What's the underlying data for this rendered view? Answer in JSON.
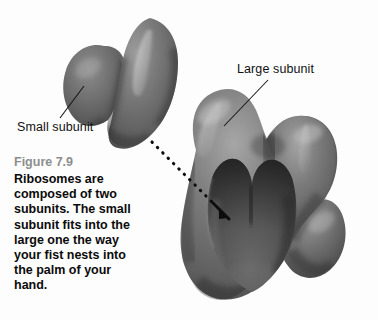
{
  "figure": {
    "background_color": "#fdfdfd",
    "labels": {
      "small_subunit": "Small subunit",
      "large_subunit": "Large subunit"
    },
    "caption": {
      "figure_number": "Figure 7.9",
      "body": "Ribosomes are composed of two subunits. The small subunit fits into the large one the way your fist nests into the palm of your hand.",
      "number_color": "#8d8d8d",
      "body_color": "#0b0b0b"
    },
    "illustration": {
      "small_subunit_name": "small-subunit-shape",
      "large_subunit_name": "large-subunit-shape",
      "cavity_name": "large-subunit-cavity",
      "arrow_name": "fit-direction-dotted-arrow",
      "base_gray": "#6e6e6e",
      "shadow_gray": "#3c3c3c",
      "highlight_gray": "#bdbdbd",
      "cavity_gray": "#4a4a4a",
      "leader_line_color": "#1a1a1a"
    }
  }
}
